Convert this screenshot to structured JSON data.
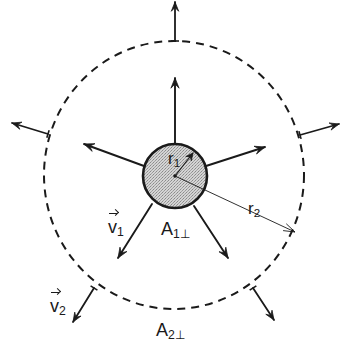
{
  "diagram": {
    "title": "",
    "center": {
      "x": 175,
      "y": 176
    },
    "inner_circle": {
      "cx": 175,
      "cy": 176,
      "r": 32,
      "fill": "#c9c9c9",
      "stroke": "#1a1a1a",
      "label": "A1⊥"
    },
    "outer_circle": {
      "cx": 174,
      "cy": 175,
      "rx": 130,
      "ry": 134,
      "style": "dashed",
      "stroke": "#1a1a1a",
      "label": "A2⊥"
    },
    "radius_vectors": [
      {
        "name": "r1",
        "from": [
          175,
          176
        ],
        "to": [
          193,
          153
        ]
      },
      {
        "name": "r2",
        "from": [
          175,
          176
        ],
        "to": [
          295,
          232
        ]
      }
    ],
    "inner_arrows": [
      {
        "from": [
          175,
          144
        ],
        "to": [
          175,
          78
        ]
      },
      {
        "from": [
          144,
          166
        ],
        "to": [
          84,
          144
        ]
      },
      {
        "from": [
          206,
          166
        ],
        "to": [
          265,
          147
        ]
      },
      {
        "from": [
          152,
          204
        ],
        "to": [
          118,
          258
        ]
      },
      {
        "from": [
          194,
          206
        ],
        "to": [
          228,
          258
        ]
      }
    ],
    "outer_arrows": [
      {
        "from": [
          175,
          41
        ],
        "to": [
          175,
          2
        ]
      },
      {
        "from": [
          48,
          134
        ],
        "to": [
          12,
          123
        ]
      },
      {
        "from": [
          300,
          135
        ],
        "to": [
          339,
          124
        ]
      },
      {
        "from": [
          94,
          288
        ],
        "to": [
          73,
          322
        ]
      },
      {
        "from": [
          253,
          288
        ],
        "to": [
          274,
          320
        ]
      }
    ],
    "labels": {
      "r1": {
        "base": "r",
        "sub": "1"
      },
      "r2": {
        "base": "r",
        "sub": "2"
      },
      "v1": {
        "base": "v",
        "sub": "1"
      },
      "v2": {
        "base": "v",
        "sub": "2"
      },
      "A1": {
        "base": "A",
        "sub": "1⊥"
      },
      "A2": {
        "base": "A",
        "sub": "2⊥"
      }
    }
  }
}
